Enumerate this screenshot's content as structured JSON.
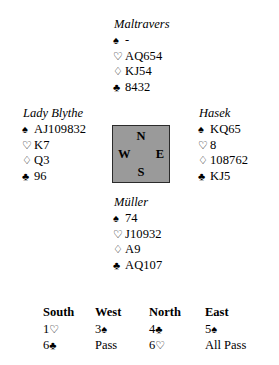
{
  "suit_symbols": {
    "spade": "♠",
    "heart": "♡",
    "diamond": "♢",
    "club": "♣"
  },
  "hands": {
    "north": {
      "player": "Maltravers",
      "spades": "-",
      "hearts": "AQ654",
      "diamonds": "KJ54",
      "clubs": "8432"
    },
    "west": {
      "player": "Lady Blythe",
      "spades": "AJ109832",
      "hearts": "K7",
      "diamonds": "Q3",
      "clubs": "96"
    },
    "east": {
      "player": "Hasek",
      "spades": "KQ65",
      "hearts": "8",
      "diamonds": "108762",
      "clubs": "KJ5"
    },
    "south": {
      "player": "Müller",
      "spades": "74",
      "hearts": "J10932",
      "diamonds": "A9",
      "clubs": "AQ107"
    }
  },
  "compass": {
    "north": "N",
    "south": "S",
    "west": "W",
    "east": "E",
    "fill_color": "#9a9a9a",
    "border_color": "#2b2b2b"
  },
  "auction": {
    "headers": {
      "south": "South",
      "west": "West",
      "north": "North",
      "east": "East"
    },
    "rounds": [
      {
        "south_level": "1",
        "south_suit": "♡",
        "west_level": "3",
        "west_suit": "♠",
        "north_level": "4",
        "north_suit": "♣",
        "east_level": "5",
        "east_suit": "♠"
      },
      {
        "south_level": "6",
        "south_suit": "♣",
        "west_level": "Pass",
        "west_suit": "",
        "north_level": "6",
        "north_suit": "♡",
        "east_level": "All Pass",
        "east_suit": ""
      }
    ]
  }
}
